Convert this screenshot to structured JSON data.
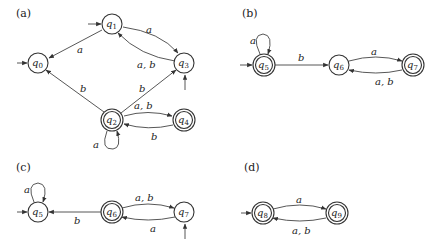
{
  "panels": [
    {
      "label": "(a)",
      "states": [
        {
          "id": "q0",
          "name": "q",
          "sub": "0",
          "x": 38,
          "y": 63,
          "accepting": false,
          "initial": "left"
        },
        {
          "id": "q1",
          "name": "q",
          "sub": "1",
          "x": 112,
          "y": 24,
          "accepting": false,
          "initial": "left"
        },
        {
          "id": "q3",
          "name": "q",
          "sub": "3",
          "x": 184,
          "y": 63,
          "accepting": false,
          "initial": "bottom"
        },
        {
          "id": "q2",
          "name": "q",
          "sub": "2",
          "x": 112,
          "y": 120,
          "accepting": true,
          "initial": null
        },
        {
          "id": "q4",
          "name": "q",
          "sub": "4",
          "x": 184,
          "y": 120,
          "accepting": true,
          "initial": null
        }
      ],
      "transitions": [
        {
          "from": "q1",
          "to": "q0",
          "label": "a"
        },
        {
          "from": "q1",
          "to": "q3",
          "label": "a"
        },
        {
          "from": "q3",
          "to": "q1",
          "label": "a, b"
        },
        {
          "from": "q2",
          "to": "q0",
          "label": "b"
        },
        {
          "from": "q2",
          "to": "q3",
          "label": "b"
        },
        {
          "from": "q2",
          "to": "q4",
          "label": "a, b"
        },
        {
          "from": "q4",
          "to": "q2",
          "label": "b"
        },
        {
          "from": "q2",
          "to": "q2",
          "label": "a"
        }
      ]
    },
    {
      "label": "(b)",
      "states": [
        {
          "id": "q5",
          "name": "q",
          "sub": "5",
          "x": 264,
          "y": 65,
          "accepting": true,
          "initial": "left"
        },
        {
          "id": "q6",
          "name": "q",
          "sub": "6",
          "x": 339,
          "y": 65,
          "accepting": false,
          "initial": null
        },
        {
          "id": "q7",
          "name": "q",
          "sub": "7",
          "x": 413,
          "y": 65,
          "accepting": true,
          "initial": null
        }
      ],
      "transitions": [
        {
          "from": "q5",
          "to": "q5",
          "label": "a"
        },
        {
          "from": "q5",
          "to": "q6",
          "label": "b"
        },
        {
          "from": "q6",
          "to": "q7",
          "label": "a"
        },
        {
          "from": "q7",
          "to": "q6",
          "label": "a, b"
        }
      ]
    },
    {
      "label": "(c)",
      "states": [
        {
          "id": "q5",
          "name": "q",
          "sub": "5",
          "x": 38,
          "y": 212,
          "accepting": false,
          "initial": "left"
        },
        {
          "id": "q6",
          "name": "q",
          "sub": "6",
          "x": 112,
          "y": 212,
          "accepting": true,
          "initial": null
        },
        {
          "id": "q7",
          "name": "q",
          "sub": "7",
          "x": 184,
          "y": 212,
          "accepting": false,
          "initial": "bottom"
        }
      ],
      "transitions": [
        {
          "from": "q5",
          "to": "q5",
          "label": "a"
        },
        {
          "from": "q6",
          "to": "q5",
          "label": "b"
        },
        {
          "from": "q6",
          "to": "q7",
          "label": "a, b"
        },
        {
          "from": "q7",
          "to": "q6",
          "label": "a"
        }
      ]
    },
    {
      "label": "(d)",
      "states": [
        {
          "id": "q8",
          "name": "q",
          "sub": "8",
          "x": 263,
          "y": 213,
          "accepting": true,
          "initial": "left"
        },
        {
          "id": "q9",
          "name": "q",
          "sub": "9",
          "x": 337,
          "y": 213,
          "accepting": true,
          "initial": null
        }
      ],
      "transitions": [
        {
          "from": "q8",
          "to": "q9",
          "label": "a"
        },
        {
          "from": "q9",
          "to": "q8",
          "label": "a, b"
        }
      ]
    }
  ],
  "labels": {
    "a": {
      "panel": "(a)",
      "e_q1_q0": "a",
      "e_q1_q3": "a",
      "e_q3_q1": "a, b",
      "e_q2_q0": "b",
      "e_q2_q3": "b",
      "e_q2_q4": "a, b",
      "e_q4_q2": "b",
      "e_q2_loop": "a"
    },
    "b": {
      "panel": "(b)",
      "e_q5_loop": "a",
      "e_q5_q6": "b",
      "e_q6_q7": "a",
      "e_q7_q6": "a, b"
    },
    "c": {
      "panel": "(c)",
      "e_q5_loop": "a",
      "e_q6_q5": "b",
      "e_q6_q7": "a, b",
      "e_q7_q6": "a"
    },
    "d": {
      "panel": "(d)",
      "e_q8_q9": "a",
      "e_q9_q8": "a, b"
    },
    "states": {
      "q": "q",
      "s0": "0",
      "s1": "1",
      "s2": "2",
      "s3": "3",
      "s4": "4",
      "s5": "5",
      "s6": "6",
      "s7": "7",
      "s8": "8",
      "s9": "9"
    }
  }
}
